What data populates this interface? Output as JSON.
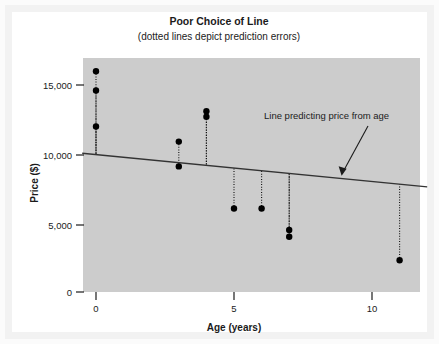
{
  "figure": {
    "title": "Poor Choice of Line",
    "subtitle": "(dotted lines depict prediction errors)",
    "background_color": "#ffffff",
    "panel_color": "#cccccc"
  },
  "chart_data": {
    "type": "scatter",
    "title": "Poor Choice of Line",
    "subtitle": "(dotted lines depict prediction errors)",
    "xlabel": "Age (years)",
    "ylabel": "Price ($)",
    "xlim": [
      -0.5,
      12.0
    ],
    "ylim": [
      0,
      16800
    ],
    "xticks": [
      0,
      5,
      10
    ],
    "xtick_labels": [
      "0",
      "5",
      "10"
    ],
    "yticks": [
      0,
      5000,
      10000,
      15000
    ],
    "ytick_labels": [
      "0",
      "5,000",
      "10,000",
      "15,000"
    ],
    "grid": false,
    "legend": "none",
    "point_color": "#000000",
    "line_color": "#333333",
    "residual_style": "dotted",
    "points": [
      {
        "x": 0,
        "y": 16000
      },
      {
        "x": 0,
        "y": 14600
      },
      {
        "x": 0,
        "y": 12000
      },
      {
        "x": 3,
        "y": 10900
      },
      {
        "x": 3,
        "y": 9100
      },
      {
        "x": 4,
        "y": 13100
      },
      {
        "x": 4,
        "y": 12700
      },
      {
        "x": 5,
        "y": 6050
      },
      {
        "x": 6,
        "y": 6050
      },
      {
        "x": 7,
        "y": 4500
      },
      {
        "x": 7,
        "y": 4000
      },
      {
        "x": 11,
        "y": 2300
      }
    ],
    "series": [
      {
        "name": "Line predicting price from age",
        "type": "line",
        "x": [
          -0.5,
          12.0
        ],
        "values": [
          10050,
          7620
        ],
        "intercept": 9960,
        "slope": -195
      }
    ],
    "annotations": [
      {
        "text": "Line predicting price from age",
        "x": 9.0,
        "y": 12600,
        "arrow_to_x": 8.9,
        "arrow_to_y": 8420
      }
    ]
  },
  "axes": {
    "x_title": "Age (years)",
    "y_title": "Price ($)"
  },
  "annotation": {
    "label": "Line predicting price from age"
  }
}
